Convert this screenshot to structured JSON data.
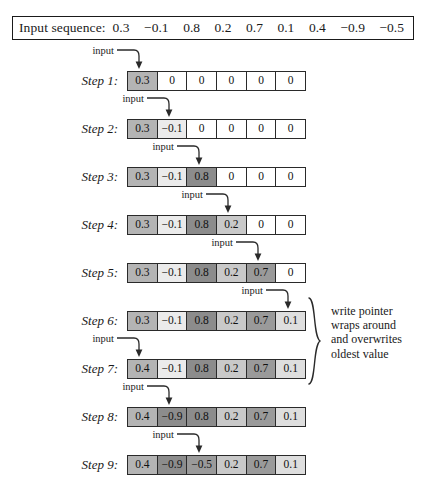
{
  "header": {
    "label": "Input sequence:",
    "sequence": [
      "0.3",
      "−0.1",
      "0.8",
      "0.2",
      "0.7",
      "0.1",
      "0.4",
      "−0.9",
      "−0.5"
    ]
  },
  "annotation": {
    "input_label": "input",
    "note_lines": [
      "write pointer",
      "wraps around",
      "and overwrites",
      "oldest value"
    ]
  },
  "colors": {
    "border": "#2a2a2a",
    "background": "#ffffff",
    "empty_cell": "#ffffff",
    "shade_lightest": "#ebebeb",
    "shade_darkest": "#8c8c8c"
  },
  "buffer": {
    "cell_count": 6
  },
  "steps": [
    {
      "label": "Step 1:",
      "write_index": 0,
      "cells": [
        {
          "value": "0.3",
          "shade": 4
        },
        {
          "value": "0",
          "shade": 0
        },
        {
          "value": "0",
          "shade": 0
        },
        {
          "value": "0",
          "shade": 0
        },
        {
          "value": "0",
          "shade": 0
        },
        {
          "value": "0",
          "shade": 0
        }
      ]
    },
    {
      "label": "Step 2:",
      "write_index": 1,
      "cells": [
        {
          "value": "0.3",
          "shade": 4
        },
        {
          "value": "−0.1",
          "shade": 1
        },
        {
          "value": "0",
          "shade": 0
        },
        {
          "value": "0",
          "shade": 0
        },
        {
          "value": "0",
          "shade": 0
        },
        {
          "value": "0",
          "shade": 0
        }
      ]
    },
    {
      "label": "Step 3:",
      "write_index": 2,
      "cells": [
        {
          "value": "0.3",
          "shade": 4
        },
        {
          "value": "−0.1",
          "shade": 1
        },
        {
          "value": "0.8",
          "shade": 6
        },
        {
          "value": "0",
          "shade": 0
        },
        {
          "value": "0",
          "shade": 0
        },
        {
          "value": "0",
          "shade": 0
        }
      ]
    },
    {
      "label": "Step 4:",
      "write_index": 3,
      "cells": [
        {
          "value": "0.3",
          "shade": 4
        },
        {
          "value": "−0.1",
          "shade": 1
        },
        {
          "value": "0.8",
          "shade": 6
        },
        {
          "value": "0.2",
          "shade": 3
        },
        {
          "value": "0",
          "shade": 0
        },
        {
          "value": "0",
          "shade": 0
        }
      ]
    },
    {
      "label": "Step 5:",
      "write_index": 4,
      "cells": [
        {
          "value": "0.3",
          "shade": 4
        },
        {
          "value": "−0.1",
          "shade": 1
        },
        {
          "value": "0.8",
          "shade": 6
        },
        {
          "value": "0.2",
          "shade": 3
        },
        {
          "value": "0.7",
          "shade": 5
        },
        {
          "value": "0",
          "shade": 0
        }
      ]
    },
    {
      "label": "Step 6:",
      "write_index": 5,
      "cells": [
        {
          "value": "0.3",
          "shade": 4
        },
        {
          "value": "−0.1",
          "shade": 1
        },
        {
          "value": "0.8",
          "shade": 6
        },
        {
          "value": "0.2",
          "shade": 3
        },
        {
          "value": "0.7",
          "shade": 5
        },
        {
          "value": "0.1",
          "shade": 2
        }
      ]
    },
    {
      "label": "Step 7:",
      "write_index": 0,
      "cells": [
        {
          "value": "0.4",
          "shade": 4
        },
        {
          "value": "−0.1",
          "shade": 1
        },
        {
          "value": "0.8",
          "shade": 6
        },
        {
          "value": "0.2",
          "shade": 3
        },
        {
          "value": "0.7",
          "shade": 5
        },
        {
          "value": "0.1",
          "shade": 2
        }
      ]
    },
    {
      "label": "Step 8:",
      "write_index": 1,
      "cells": [
        {
          "value": "0.4",
          "shade": 4
        },
        {
          "value": "−0.9",
          "shade": 6
        },
        {
          "value": "0.8",
          "shade": 6
        },
        {
          "value": "0.2",
          "shade": 3
        },
        {
          "value": "0.7",
          "shade": 5
        },
        {
          "value": "0.1",
          "shade": 2
        }
      ]
    },
    {
      "label": "Step 9:",
      "write_index": 2,
      "cells": [
        {
          "value": "0.4",
          "shade": 4
        },
        {
          "value": "−0.9",
          "shade": 6
        },
        {
          "value": "−0.5",
          "shade": 5
        },
        {
          "value": "0.2",
          "shade": 3
        },
        {
          "value": "0.7",
          "shade": 5
        },
        {
          "value": "0.1",
          "shade": 2
        }
      ]
    }
  ]
}
